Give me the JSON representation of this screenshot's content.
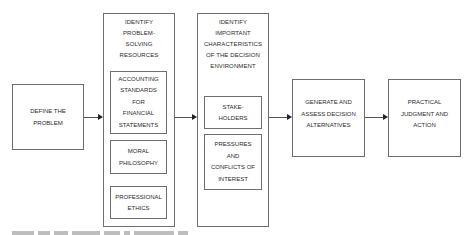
{
  "diagram": {
    "type": "flowchart",
    "direction": "left-to-right",
    "steps": [
      {
        "id": "define",
        "label": "DEFINE THE\nPROBLEM"
      },
      {
        "id": "resources",
        "label": "IDENTIFY\nPROBLEM-\nSOLVING\nRESOURCES",
        "children": [
          {
            "label": "ACCOUNTING\nSTANDARDS\nFOR\nFINANCIAL\nSTATEMENTS"
          },
          {
            "label": "MORAL\nPHILOSOPHY"
          },
          {
            "label": "PROFESSIONAL\nETHICS"
          }
        ]
      },
      {
        "id": "environment",
        "label": "IDENTIFY\nIMPORTANT\nCHARACTERISTICS\nOF THE DECISION\nENVIRONMENT",
        "children": [
          {
            "label": "STAKE-\nHOLDERS"
          },
          {
            "label": "PRESSURES\nAND\nCONFLICTS OF\nINTEREST"
          }
        ]
      },
      {
        "id": "generate",
        "label": "GENERATE AND\nASSESS DECISION\nALTERNATIVES"
      },
      {
        "id": "practical",
        "label": "PRACTICAL\nJUDGMENT AND\nACTION"
      }
    ],
    "edges": [
      {
        "from": "define",
        "to": "resources"
      },
      {
        "from": "resources",
        "to": "environment"
      },
      {
        "from": "environment",
        "to": "generate"
      },
      {
        "from": "generate",
        "to": "practical"
      }
    ],
    "colors": {
      "border": "#6e6e6e",
      "arrow": "#555555",
      "text": "#2a2a2a",
      "background": "#ffffff"
    }
  }
}
